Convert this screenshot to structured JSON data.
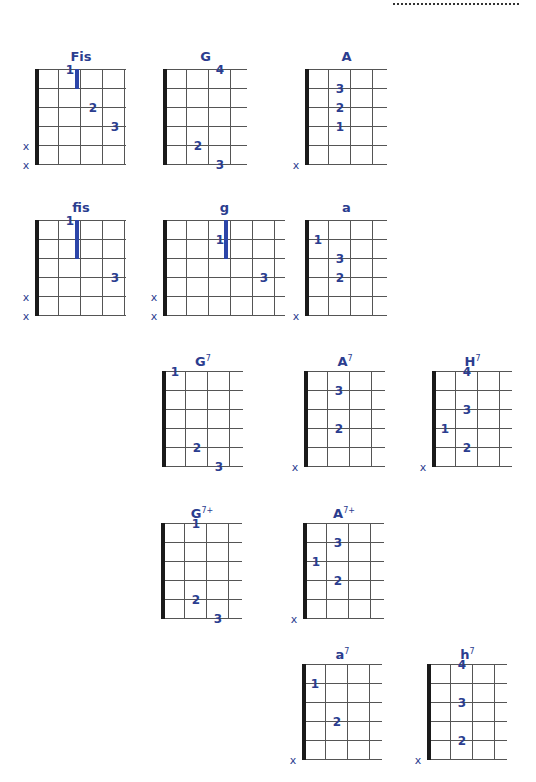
{
  "page": {
    "header_rule": "dotted-line"
  },
  "colors": {
    "ink": "#2b3d8f",
    "grid": "#555555",
    "nut": "#1a1a1a",
    "barre": "#2c45a8"
  },
  "chords": [
    {
      "id": "Fis",
      "name": "Fis",
      "sup": "",
      "x": 36,
      "y": 69,
      "frets": 4,
      "width": 90,
      "fingers": [
        {
          "label": "1",
          "string": 0,
          "x": 34,
          "dy": 0
        },
        {
          "label": "2",
          "string": 2,
          "x": 57
        },
        {
          "label": "3",
          "string": 3,
          "x": 79
        }
      ],
      "barre": {
        "x": 41,
        "from": 0,
        "to": 1
      },
      "muted": [
        4,
        5
      ]
    },
    {
      "id": "G",
      "name": "G",
      "sup": "",
      "x": 164,
      "y": 69,
      "frets": 4,
      "width": 83,
      "fingers": [
        {
          "label": "4",
          "string": 0,
          "x": 56
        },
        {
          "label": "2",
          "string": 4,
          "x": 34
        },
        {
          "label": "3",
          "string": 5,
          "x": 56
        }
      ],
      "muted": []
    },
    {
      "id": "A",
      "name": "A",
      "sup": "",
      "x": 306,
      "y": 69,
      "frets": 4,
      "width": 81,
      "fingers": [
        {
          "label": "3",
          "string": 1,
          "x": 34
        },
        {
          "label": "2",
          "string": 2,
          "x": 34
        },
        {
          "label": "1",
          "string": 3,
          "x": 34
        }
      ],
      "muted": [
        5
      ]
    },
    {
      "id": "fis",
      "name": "fis",
      "sup": "",
      "x": 36,
      "y": 220,
      "frets": 4,
      "width": 90,
      "fingers": [
        {
          "label": "1",
          "string": 0,
          "x": 34
        },
        {
          "label": "3",
          "string": 3,
          "x": 79
        }
      ],
      "barre": {
        "x": 41,
        "from": 0,
        "to": 2
      },
      "muted": [
        4,
        5
      ]
    },
    {
      "id": "g",
      "name": "g",
      "sup": "",
      "x": 164,
      "y": 220,
      "frets": 5,
      "width": 121,
      "fingers": [
        {
          "label": "1",
          "string": 1,
          "x": 56
        },
        {
          "label": "3",
          "string": 3,
          "x": 100
        }
      ],
      "barre": {
        "x": 62,
        "from": 0,
        "to": 2
      },
      "muted": [
        4,
        5
      ]
    },
    {
      "id": "a",
      "name": "a",
      "sup": "",
      "x": 306,
      "y": 220,
      "frets": 4,
      "width": 81,
      "fingers": [
        {
          "label": "1",
          "string": 1,
          "x": 12
        },
        {
          "label": "3",
          "string": 2,
          "x": 34
        },
        {
          "label": "2",
          "string": 3,
          "x": 34
        }
      ],
      "muted": [
        5
      ]
    },
    {
      "id": "G7",
      "name": "G",
      "sup": "7",
      "x": 163,
      "y": 371,
      "frets": 4,
      "width": 80,
      "fingers": [
        {
          "label": "1",
          "string": 0,
          "x": 12
        },
        {
          "label": "2",
          "string": 4,
          "x": 34
        },
        {
          "label": "3",
          "string": 5,
          "x": 56
        }
      ],
      "muted": []
    },
    {
      "id": "A7",
      "name": "A",
      "sup": "7",
      "x": 305,
      "y": 371,
      "frets": 4,
      "width": 80,
      "fingers": [
        {
          "label": "3",
          "string": 1,
          "x": 34
        },
        {
          "label": "2",
          "string": 3,
          "x": 34
        }
      ],
      "muted": [
        5
      ]
    },
    {
      "id": "H7",
      "name": "H",
      "sup": "7",
      "x": 433,
      "y": 371,
      "frets": 4,
      "width": 79,
      "fingers": [
        {
          "label": "4",
          "string": 0,
          "x": 34
        },
        {
          "label": "3",
          "string": 2,
          "x": 34
        },
        {
          "label": "1",
          "string": 3,
          "x": 12
        },
        {
          "label": "2",
          "string": 4,
          "x": 34
        }
      ],
      "muted": [
        5
      ]
    },
    {
      "id": "G7plus",
      "name": "G",
      "sup": "7+",
      "x": 162,
      "y": 523,
      "frets": 4,
      "width": 80,
      "fingers": [
        {
          "label": "1",
          "string": 0,
          "x": 34
        },
        {
          "label": "2",
          "string": 4,
          "x": 34
        },
        {
          "label": "3",
          "string": 5,
          "x": 56
        }
      ],
      "muted": []
    },
    {
      "id": "A7plus",
      "name": "A",
      "sup": "7+",
      "x": 304,
      "y": 523,
      "frets": 4,
      "width": 80,
      "fingers": [
        {
          "label": "3",
          "string": 1,
          "x": 34
        },
        {
          "label": "1",
          "string": 2,
          "x": 12
        },
        {
          "label": "2",
          "string": 3,
          "x": 34
        }
      ],
      "muted": [
        5
      ]
    },
    {
      "id": "a7",
      "name": "a",
      "sup": "7",
      "x": 303,
      "y": 664,
      "frets": 4,
      "width": 79,
      "fingers": [
        {
          "label": "1",
          "string": 1,
          "x": 12
        },
        {
          "label": "2",
          "string": 3,
          "x": 34
        }
      ],
      "muted": [
        5
      ]
    },
    {
      "id": "h7",
      "name": "h",
      "sup": "7",
      "x": 428,
      "y": 664,
      "frets": 4,
      "width": 79,
      "fingers": [
        {
          "label": "4",
          "string": 0,
          "x": 34
        },
        {
          "label": "3",
          "string": 2,
          "x": 34
        },
        {
          "label": "2",
          "string": 4,
          "x": 34
        }
      ],
      "muted": [
        5
      ]
    }
  ],
  "labels": {
    "mute_symbol": "x"
  }
}
